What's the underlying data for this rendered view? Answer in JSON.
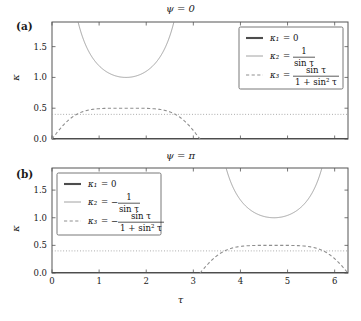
{
  "figure": {
    "width": 361,
    "height": 321,
    "background": "#ffffff",
    "axis_color": "#555555",
    "panels": [
      {
        "tag": "(a)",
        "title": "ψ = 0",
        "legend_position": "top-right",
        "series_sign": "+",
        "legend": [
          {
            "style": "thick-solid",
            "lhs": "κ₁",
            "eq": "=",
            "rhs_plain": "0",
            "rhs_type": "plain"
          },
          {
            "style": "thin-solid",
            "lhs": "κ₂",
            "eq": "=",
            "rhs_type": "fraction",
            "sign": "",
            "numer": "1",
            "denom": "sin τ"
          },
          {
            "style": "dashed",
            "lhs": "κ₃",
            "eq": "=",
            "rhs_type": "fraction",
            "sign": "",
            "numer": "sin τ",
            "denom": "1 + sin² τ"
          }
        ]
      },
      {
        "tag": "(b)",
        "title": "ψ = π",
        "legend_position": "top-left",
        "series_sign": "-",
        "legend": [
          {
            "style": "thick-solid",
            "lhs": "κ₁",
            "eq": "=",
            "rhs_plain": "0",
            "rhs_type": "plain"
          },
          {
            "style": "thin-solid",
            "lhs": "κ₂",
            "eq": "=",
            "rhs_type": "fraction",
            "sign": "−",
            "numer": "1",
            "denom": "sin τ"
          },
          {
            "style": "dashed",
            "lhs": "κ₃",
            "eq": "=",
            "rhs_type": "fraction",
            "sign": "−",
            "numer": "sin τ",
            "denom": "1 + sin² τ"
          }
        ]
      }
    ]
  },
  "chart_data": {
    "type": "line",
    "xlabel": "τ",
    "ylabel": "κ",
    "xlim": [
      0,
      6.2832
    ],
    "ylim": [
      0,
      1.9
    ],
    "xticks": [
      0,
      1,
      2,
      3,
      4,
      5,
      6
    ],
    "xticklabels": [
      "0",
      "1",
      "2",
      "3",
      "4",
      "5",
      "6"
    ],
    "yticks": [
      0.0,
      0.5,
      1.0,
      1.5
    ],
    "yticklabels": [
      "0.0",
      "0.5",
      "1.0",
      "1.5"
    ],
    "grid": false,
    "legend_entries": [
      "κ₁ = 0",
      "κ₂ = 1/sin τ",
      "κ₃ = sin τ/(1 + sin² τ)"
    ],
    "panels": [
      {
        "name": "panel-a",
        "title": "ψ = 0",
        "series": [
          {
            "name": "κ₁ = 0",
            "style": "thick-solid",
            "constant": 0,
            "domain": [
              0,
              6.2832
            ],
            "note": "flat line lying on the τ axis at κ = 0"
          },
          {
            "name": "κ₂ = 1/sin τ",
            "style": "thin-solid",
            "formula": "1/sin(t)",
            "visible_domain": [
              0,
              3.1416
            ],
            "minimum": {
              "x": 1.5708,
              "y": 1.0
            },
            "asymptotes": [
              0,
              3.1416
            ],
            "clipped_above": 1.9,
            "note": "U shaped branch rising out of the top of the frame near τ = 0.55 and τ = 2.6"
          },
          {
            "name": "κ₃ = sin τ/(1 + sin² τ)",
            "style": "dashed",
            "formula": "sin(t)/(1+sin(t)^2)",
            "visible_domain": [
              0,
              3.1416
            ],
            "maximum": {
              "x": 1.5708,
              "y": 0.5
            },
            "zeros": [
              0,
              3.1416
            ]
          },
          {
            "name": "reference level",
            "style": "dotted",
            "constant": 0.4,
            "domain": [
              0,
              6.2832
            ],
            "note": "horizontal dotted guide line at κ ≈ 0.4"
          }
        ]
      },
      {
        "name": "panel-b",
        "title": "ψ = π",
        "series": [
          {
            "name": "κ₁ = 0",
            "style": "thick-solid",
            "constant": 0,
            "domain": [
              0,
              6.2832
            ],
            "note": "flat line lying on the τ axis at κ = 0"
          },
          {
            "name": "κ₂ = −1/sin τ",
            "style": "thin-solid",
            "formula": "-1/sin(t)",
            "visible_domain": [
              3.1416,
              6.2832
            ],
            "minimum": {
              "x": 4.7124,
              "y": 1.0
            },
            "asymptotes": [
              3.1416,
              6.2832
            ],
            "clipped_above": 1.9,
            "note": "U shaped branch rising out of the top of the frame near τ = 3.7 and τ = 5.75"
          },
          {
            "name": "κ₃ = −sin τ/(1 + sin² τ)",
            "style": "dashed",
            "formula": "-sin(t)/(1+sin(t)^2)",
            "visible_domain": [
              3.1416,
              6.2832
            ],
            "maximum": {
              "x": 4.7124,
              "y": 0.5
            },
            "zeros": [
              3.1416,
              6.2832
            ]
          },
          {
            "name": "reference level",
            "style": "dotted",
            "constant": 0.4,
            "domain": [
              0,
              6.2832
            ],
            "note": "horizontal dotted guide line at κ ≈ 0.4"
          }
        ]
      }
    ]
  }
}
